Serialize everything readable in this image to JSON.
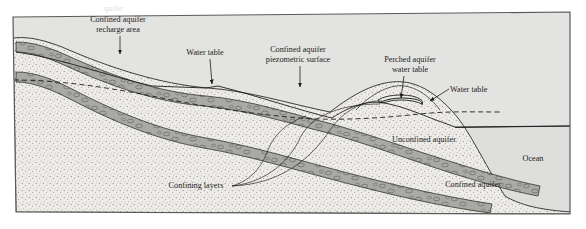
{
  "figure": {
    "type": "geological-cross-section",
    "frame": {
      "border_color": "#5a5a5a",
      "sky_fill": "#e3e3e1"
    },
    "colors": {
      "sky": "#e3e3e1",
      "sand": "#eceae6",
      "aquifer_gravel": "#a8a8a4",
      "ocean": "#dededc",
      "line": "#1d1d1d",
      "text": "#1d1d1d"
    }
  },
  "labels": {
    "confined_recharge": {
      "line1": "Confined aquifer",
      "line2": "recharge area"
    },
    "water_table_left": "Water table",
    "piezometric": {
      "line1": "Confined aquifer",
      "line2": "piezometric surface"
    },
    "perched": {
      "line1": "Perched aquifer",
      "line2": "water table"
    },
    "water_table_right": "Water table",
    "unconfined": "Unconfined aquifer",
    "confining_layers": "Confining layers",
    "confined_aquifer": "Confined aquifer",
    "ocean": "Ocean"
  }
}
